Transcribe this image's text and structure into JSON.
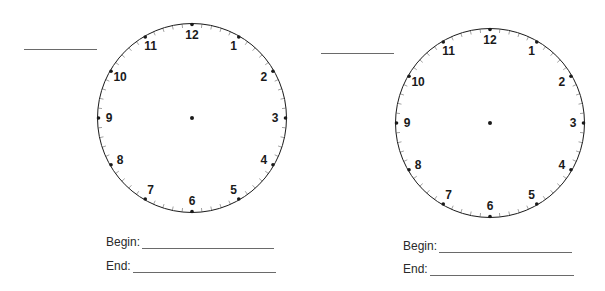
{
  "worksheet": {
    "clocks": [
      {
        "id": "clock-1",
        "center": [
          192,
          118
        ],
        "radius": 95,
        "numbers": [
          "12",
          "1",
          "2",
          "3",
          "4",
          "5",
          "6",
          "7",
          "8",
          "9",
          "10",
          "11"
        ],
        "name_line": {
          "x": 24,
          "y": 49,
          "width": 73
        },
        "begin": {
          "label": "Begin:",
          "value": ""
        },
        "end": {
          "label": "End:",
          "value": ""
        }
      },
      {
        "id": "clock-2",
        "center": [
          490,
          123
        ],
        "radius": 95,
        "numbers": [
          "12",
          "1",
          "2",
          "3",
          "4",
          "5",
          "6",
          "7",
          "8",
          "9",
          "10",
          "11"
        ],
        "name_line": {
          "x": 321,
          "y": 53,
          "width": 73
        },
        "begin": {
          "label": "Begin:",
          "value": ""
        },
        "end": {
          "label": "End:",
          "value": ""
        }
      }
    ],
    "colors": {
      "ink": "#1a1a1a",
      "line": "#6a6a6a",
      "tick": "#8a8a8a"
    }
  }
}
